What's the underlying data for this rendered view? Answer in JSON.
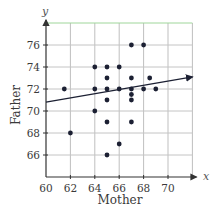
{
  "chart_data": {
    "type": "scatter",
    "title": "",
    "xlabel": "Mother",
    "ylabel": "Father",
    "x_axis_var": "x",
    "y_axis_var": "y",
    "xlim": [
      60,
      74
    ],
    "ylim": [
      64,
      78
    ],
    "x_ticks": [
      60,
      62,
      64,
      66,
      68,
      70
    ],
    "y_ticks": [
      66,
      68,
      70,
      72,
      74,
      76
    ],
    "grid": true,
    "legend": null,
    "series": [
      {
        "name": "Father vs Mother height",
        "color": "#1c2033",
        "points": [
          {
            "x": 61.5,
            "y": 72
          },
          {
            "x": 62,
            "y": 68
          },
          {
            "x": 64,
            "y": 74
          },
          {
            "x": 64,
            "y": 72
          },
          {
            "x": 64,
            "y": 70
          },
          {
            "x": 65,
            "y": 74
          },
          {
            "x": 65,
            "y": 73
          },
          {
            "x": 65,
            "y": 72
          },
          {
            "x": 65,
            "y": 71
          },
          {
            "x": 65,
            "y": 69
          },
          {
            "x": 65,
            "y": 66
          },
          {
            "x": 66,
            "y": 74
          },
          {
            "x": 66,
            "y": 72
          },
          {
            "x": 66,
            "y": 67
          },
          {
            "x": 67,
            "y": 76
          },
          {
            "x": 67,
            "y": 73
          },
          {
            "x": 67,
            "y": 72
          },
          {
            "x": 67,
            "y": 71.5
          },
          {
            "x": 67,
            "y": 71
          },
          {
            "x": 67,
            "y": 69
          },
          {
            "x": 68,
            "y": 76
          },
          {
            "x": 68,
            "y": 72
          },
          {
            "x": 68.5,
            "y": 73
          },
          {
            "x": 69,
            "y": 72
          }
        ]
      }
    ],
    "regression_line": {
      "x_start": 60,
      "y_start": 70.8,
      "x_end": 72,
      "y_end": 73.1,
      "color": "#1c2033",
      "arrow": true
    }
  }
}
